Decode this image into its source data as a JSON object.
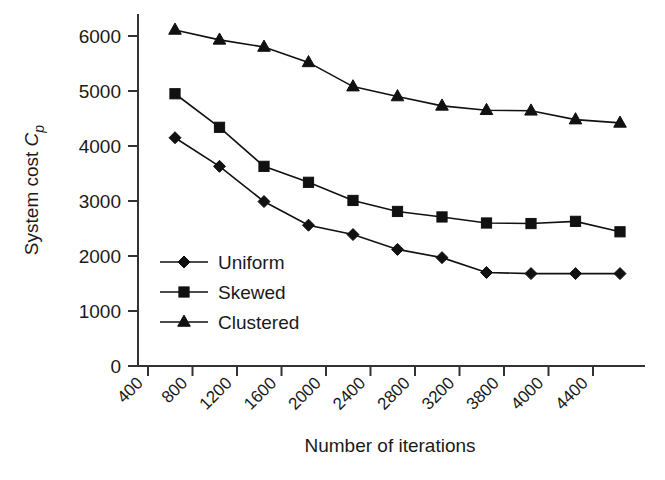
{
  "chart_data": {
    "type": "line",
    "title": "",
    "xlabel": "Number of iterations",
    "ylabel": "System cost C",
    "ylabel_sub": "p",
    "x_tick_labels": [
      "400",
      "800",
      "1200",
      "1600",
      "2000",
      "2400",
      "2800",
      "3200",
      "3800",
      "4000",
      "4400"
    ],
    "y_tick_labels": [
      "0",
      "1000",
      "2000",
      "3000",
      "4000",
      "5000",
      "6000"
    ],
    "ylim": [
      0,
      6400
    ],
    "yticks": [
      0,
      1000,
      2000,
      3000,
      4000,
      5000,
      6000
    ],
    "grid": false,
    "legend_position": "inside-lower-left",
    "x": [
      400,
      800,
      1200,
      1600,
      2000,
      2400,
      2800,
      3200,
      3800,
      4000,
      4400
    ],
    "series": [
      {
        "name": "Uniform",
        "marker": "diamond",
        "color": "#111111",
        "values": [
          4150,
          3630,
          2990,
          2560,
          2390,
          2120,
          1970,
          1700,
          1680,
          1680,
          1680
        ]
      },
      {
        "name": "Skewed",
        "marker": "square",
        "color": "#111111",
        "values": [
          4950,
          4340,
          3630,
          3340,
          3010,
          2810,
          2710,
          2600,
          2590,
          2630,
          2440
        ]
      },
      {
        "name": "Clustered",
        "marker": "triangle",
        "color": "#111111",
        "values": [
          6110,
          5930,
          5800,
          5520,
          5080,
          4900,
          4730,
          4650,
          4640,
          4480,
          4420
        ]
      }
    ]
  },
  "legend": {
    "entries": [
      {
        "label": "Uniform",
        "marker": "diamond"
      },
      {
        "label": "Skewed",
        "marker": "square"
      },
      {
        "label": "Clustered",
        "marker": "triangle"
      }
    ]
  },
  "axes": {
    "x_title": "Number of iterations",
    "y_title_main": "System cost ",
    "y_title_var": "C",
    "y_title_sub": "p"
  }
}
